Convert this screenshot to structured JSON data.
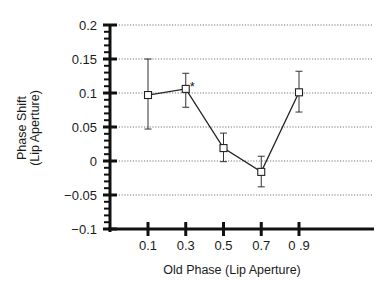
{
  "chart_data": {
    "type": "line",
    "title": "",
    "xlabel": "Old Phase (Lip Aperture)",
    "ylabel_lines": [
      "Phase Shift",
      "(Lip Aperture)"
    ],
    "ylabel": "Phase Shift (Lip Aperture)",
    "x_tick_labels": [
      "0.1",
      "0.3",
      "0.5",
      "0.7",
      "0 .9"
    ],
    "y_tick_labels": [
      "0.2",
      "0.15",
      "0.1",
      "0.05",
      "0",
      "−0.05",
      "−0.1"
    ],
    "y_ticks": [
      0.2,
      0.15,
      0.1,
      0.05,
      0,
      -0.05,
      -0.1
    ],
    "ylim": [
      -0.1,
      0.2
    ],
    "grid": "horizontal dotted",
    "legend": null,
    "series": [
      {
        "name": "Phase Shift",
        "marker": "open-square",
        "x": [
          0.1,
          0.3,
          0.5,
          0.7,
          0.9
        ],
        "values": [
          0.097,
          0.106,
          0.019,
          -0.016,
          0.101
        ],
        "error_upper": [
          0.15,
          0.129,
          0.041,
          0.007,
          0.132
        ],
        "error_lower": [
          0.047,
          0.079,
          -0.001,
          -0.038,
          0.072
        ]
      }
    ],
    "annotations": [
      {
        "text": "*",
        "x": 0.3,
        "y": 0.106
      }
    ]
  }
}
